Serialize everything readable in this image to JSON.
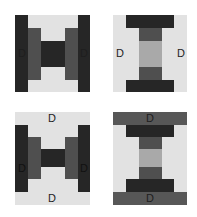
{
  "colors": {
    "dark": "#262626",
    "medium": "#4f4f4f",
    "mid_dark": "#575757",
    "light": "#e2e2e2",
    "light_gray": "#a9a9a9",
    "background": "#ffffff"
  },
  "blocks": [
    {
      "id": "block-1",
      "position": "top-left",
      "labels": [
        "D",
        "D"
      ],
      "label_placement": "left and right outer bars"
    },
    {
      "id": "block-2",
      "position": "top-right",
      "labels": [
        "D",
        "D"
      ],
      "label_placement": "left and right outer bars"
    },
    {
      "id": "block-3",
      "position": "bottom-left",
      "labels": [
        "D",
        "D",
        "D",
        "D"
      ],
      "label_placement": "top, bottom, left and right outer bars"
    },
    {
      "id": "block-4",
      "position": "bottom-right",
      "labels": [
        "D",
        "D"
      ],
      "label_placement": "top and bottom outer bars"
    }
  ]
}
